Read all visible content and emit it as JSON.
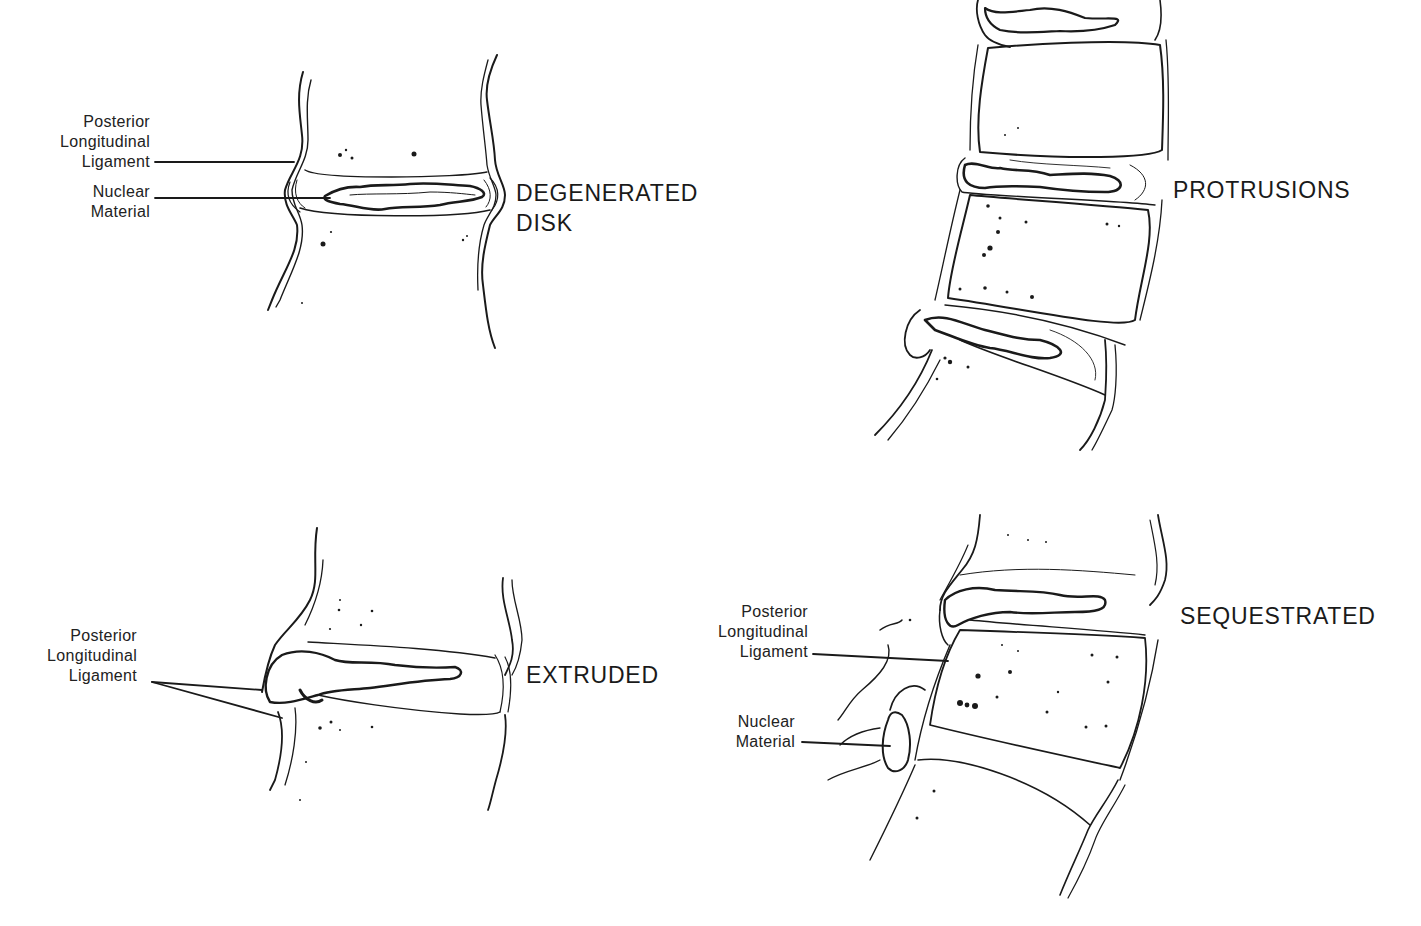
{
  "figure": {
    "type": "anatomical line illustration",
    "panels": [
      {
        "id": "degenerated",
        "title_lines": [
          "DEGENERATED",
          "DISK"
        ],
        "callouts": [
          {
            "lines": [
              "Posterior",
              "Longitudinal",
              "Ligament"
            ]
          },
          {
            "lines": [
              "Nuclear",
              "Material"
            ]
          }
        ]
      },
      {
        "id": "protrusions",
        "title_lines": [
          "PROTRUSIONS"
        ],
        "callouts": []
      },
      {
        "id": "extruded",
        "title_lines": [
          "EXTRUDED"
        ],
        "callouts": [
          {
            "lines": [
              "Posterior",
              "Longitudinal",
              "Ligament"
            ]
          }
        ]
      },
      {
        "id": "sequestrated",
        "title_lines": [
          "SEQUESTRATED"
        ],
        "callouts": [
          {
            "lines": [
              "Posterior",
              "Longitudinal",
              "Ligament"
            ]
          },
          {
            "lines": [
              "Nuclear",
              "Material"
            ]
          }
        ]
      }
    ],
    "colors": {
      "ink": "#1a1a1a",
      "background": "#ffffff"
    }
  }
}
